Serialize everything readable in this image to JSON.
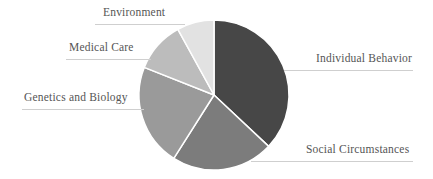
{
  "chart_data": {
    "type": "pie",
    "title": "",
    "start_angle_deg": 0,
    "direction": "clockwise",
    "slices": [
      {
        "label": "Individual Behavior",
        "value": 37,
        "color": "#474747"
      },
      {
        "label": "Social Circumstances",
        "value": 22,
        "color": "#7c7c7c"
      },
      {
        "label": "Genetics and Biology",
        "value": 22,
        "color": "#9a9a9a"
      },
      {
        "label": "Medical Care",
        "value": 11,
        "color": "#bcbcbc"
      },
      {
        "label": "Environment",
        "value": 8,
        "color": "#e2e2e2"
      }
    ],
    "legend": "leader-line labels"
  },
  "labels": {
    "individual_behavior": "Individual Behavior",
    "social_circumstances": "Social Circumstances",
    "genetics_biology": "Genetics and Biology",
    "medical_care": "Medical Care",
    "environment": "Environment"
  }
}
